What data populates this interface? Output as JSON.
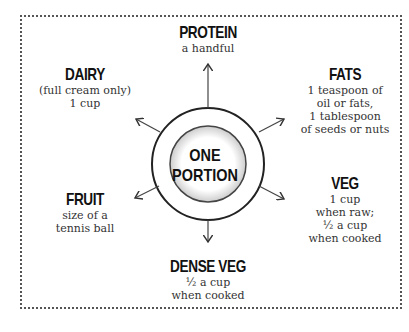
{
  "center": {
    "line1": "ONE",
    "line2": "PORTION"
  },
  "groups": {
    "protein": {
      "title": "PROTEIN",
      "lines": [
        "a handful"
      ]
    },
    "dairy": {
      "title": "DAIRY",
      "lines": [
        "(full cream only)",
        "1 cup"
      ]
    },
    "fats": {
      "title": "FATS",
      "lines": [
        "1 teaspoon of",
        "oil or fats,",
        "1 tablespoon",
        "of seeds or nuts"
      ]
    },
    "fruit": {
      "title": "FRUIT",
      "lines": [
        "size of a",
        "tennis ball"
      ]
    },
    "veg": {
      "title": "VEG",
      "lines": [
        "1 cup",
        "when raw;",
        "½ a cup",
        "when cooked"
      ]
    },
    "dense_veg": {
      "title": "DENSE VEG",
      "lines": [
        "½ a cup",
        "when cooked"
      ]
    }
  }
}
